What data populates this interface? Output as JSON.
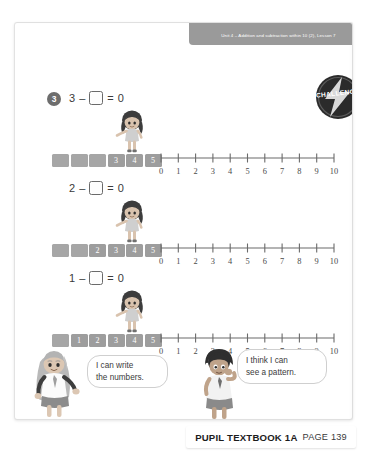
{
  "banner": {
    "text": "Unit 4 – Addition and subtraction within 10 (2), Lesson 7"
  },
  "badge": {
    "label": "CHALLENGE",
    "icon": "lightning-bolt-icon",
    "color": "#2b2b2b"
  },
  "question": {
    "number": "3"
  },
  "equations": [
    {
      "first": "3",
      "operator": "–",
      "equals": "=",
      "result": "0"
    },
    {
      "first": "2",
      "operator": "–",
      "equals": "=",
      "result": "0"
    },
    {
      "first": "1",
      "operator": "–",
      "equals": "=",
      "result": "0"
    }
  ],
  "strips": [
    {
      "cells": [
        "",
        "",
        "",
        "3",
        "4",
        "5"
      ]
    },
    {
      "cells": [
        "",
        "",
        "2",
        "3",
        "4",
        "5"
      ]
    },
    {
      "cells": [
        "",
        "1",
        "2",
        "3",
        "4",
        "5"
      ]
    }
  ],
  "numberline": {
    "labels": [
      "0",
      "1",
      "2",
      "3",
      "4",
      "5",
      "6",
      "7",
      "8",
      "9",
      "10"
    ],
    "min": 0,
    "max": 10
  },
  "bubbles": {
    "left": {
      "line1": "I can write",
      "line2": "the numbers."
    },
    "right": {
      "line1": "I think I can",
      "line2": "see a pattern."
    }
  },
  "characters": {
    "pointing_girl": "girl-pointing-avatar",
    "left_girl": "girl-speaking-avatar",
    "right_boy": "boy-thinking-avatar"
  },
  "practice_link": {
    "text": "➞ Practice book 1A p99"
  },
  "page_number": "139",
  "caption": {
    "bold": "PUPIL TEXTBOOK 1A",
    "light": "PAGE 139"
  }
}
